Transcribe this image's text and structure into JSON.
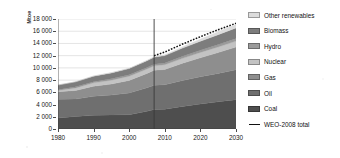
{
  "chart_data": {
    "type": "area",
    "title": "",
    "subtitle": "",
    "xlabel": "",
    "ylabel": "Mtoe",
    "stacked": true,
    "grid": true,
    "legend_position": "right",
    "xlim": [
      1980,
      2030
    ],
    "ylim": [
      0,
      18000
    ],
    "ytick_values": [
      0,
      2000,
      4000,
      6000,
      8000,
      10000,
      12000,
      14000,
      16000,
      18000
    ],
    "ytick_labels": [
      "0",
      "2 000",
      "4 000",
      "6 000",
      "8 000",
      "10 000",
      "12 000",
      "14 000",
      "16 000",
      "18 000"
    ],
    "xtick_values": [
      1980,
      1990,
      2000,
      2010,
      2020,
      2030
    ],
    "xtick_labels": [
      "1980",
      "1990",
      "2000",
      "2010",
      "2020",
      "2030"
    ],
    "projection_divider_year": 2007,
    "x": [
      1980,
      1985,
      1990,
      1995,
      2000,
      2005,
      2007,
      2010,
      2015,
      2020,
      2025,
      2030
    ],
    "series": [
      {
        "name": "Coal",
        "color": "#4e4e4e",
        "values": [
          1800,
          2050,
          2250,
          2300,
          2350,
          2900,
          3200,
          3250,
          3700,
          4100,
          4450,
          4800
        ]
      },
      {
        "name": "Oil",
        "color": "#6f6f6f",
        "values": [
          3050,
          2850,
          3100,
          3250,
          3550,
          3850,
          3950,
          4000,
          4250,
          4450,
          4650,
          4900
        ]
      },
      {
        "name": "Gas",
        "color": "#8e8e8e",
        "values": [
          1250,
          1400,
          1650,
          1800,
          2050,
          2350,
          2450,
          2500,
          2800,
          3100,
          3400,
          3700
        ]
      },
      {
        "name": "Nuclear",
        "color": "#c3c3c3",
        "values": [
          190,
          420,
          550,
          640,
          680,
          720,
          740,
          760,
          820,
          880,
          930,
          980
        ]
      },
      {
        "name": "Hydro",
        "color": "#9b9b9b",
        "values": [
          150,
          180,
          200,
          230,
          240,
          250,
          260,
          280,
          320,
          360,
          400,
          440
        ]
      },
      {
        "name": "Biomass",
        "color": "#7d7d7d",
        "values": [
          750,
          820,
          900,
          960,
          1020,
          1100,
          1150,
          1220,
          1350,
          1480,
          1600,
          1720
        ]
      },
      {
        "name": "Other renewables",
        "color": "#dcdcdc",
        "values": [
          12,
          20,
          35,
          50,
          60,
          80,
          90,
          130,
          230,
          350,
          480,
          620
        ]
      }
    ],
    "reference_line": {
      "name": "WEO-2008 total",
      "style": "dotted",
      "color": "#111111",
      "x": [
        2007,
        2010,
        2015,
        2020,
        2025,
        2030
      ],
      "values": [
        12000,
        12600,
        13900,
        15100,
        16250,
        17300
      ]
    }
  },
  "legend": {
    "items": [
      {
        "label": "Other renewables",
        "color": "#dcdcdc",
        "type": "swatch"
      },
      {
        "label": "Biomass",
        "color": "#7d7d7d",
        "type": "swatch"
      },
      {
        "label": "Hydro",
        "color": "#9b9b9b",
        "type": "swatch"
      },
      {
        "label": "Nuclear",
        "color": "#c3c3c3",
        "type": "swatch"
      },
      {
        "label": "Gas",
        "color": "#8e8e8e",
        "type": "swatch"
      },
      {
        "label": "Oil",
        "color": "#6f6f6f",
        "type": "swatch"
      },
      {
        "label": "Coal",
        "color": "#4e4e4e",
        "type": "swatch"
      },
      {
        "label": "WEO-2008 total",
        "color": "#111111",
        "type": "line"
      }
    ]
  }
}
